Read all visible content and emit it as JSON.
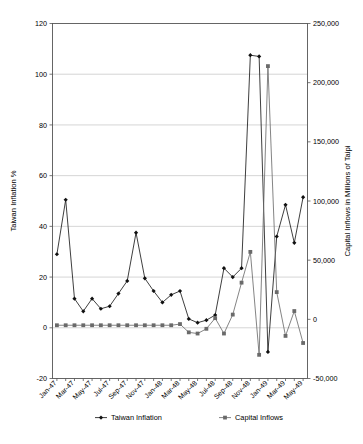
{
  "chart_data": {
    "type": "line",
    "title": "",
    "xlabel": "",
    "ylabel": "Taiwan Inflation %",
    "y2label": "Capital Inflows in Millions of Taipi",
    "ylim": [
      -20,
      120
    ],
    "y2lim": [
      -50000,
      250000
    ],
    "ytick_step": 20,
    "y2tick_step": 50000,
    "grid": true,
    "legend_position": "bottom",
    "yticks": [
      "120",
      "100",
      "80",
      "60",
      "40",
      "20",
      "0",
      "-20"
    ],
    "ytick_values": [
      120,
      100,
      80,
      60,
      40,
      20,
      0,
      -20
    ],
    "y2ticks": [
      "250,000",
      "200,000",
      "150,000",
      "100,000",
      "50,000",
      "0",
      "-50,000"
    ],
    "y2tick_values": [
      250000,
      200000,
      150000,
      100000,
      50000,
      0,
      -50000
    ],
    "x": [
      "Jan-47",
      "Feb-47",
      "Mar-47",
      "Apr-47",
      "May-47",
      "Jun-47",
      "Jul-47",
      "Aug-47",
      "Sep-47",
      "Oct-47",
      "Nov-47",
      "Dec-47",
      "Jan-48",
      "Feb-48",
      "Mar-48",
      "Apr-48",
      "May-48",
      "Jun-48",
      "Jul-48",
      "Aug-48",
      "Sep-48",
      "Oct-48",
      "Nov-48",
      "Dec-48",
      "Jan-49",
      "Feb-49",
      "Mar-49",
      "Apr-49",
      "May-49"
    ],
    "xticks_shown": [
      "Jan-47",
      "Mar-47",
      "May-47",
      "Jul-47",
      "Sep-47",
      "Nov-47",
      "Jan-48",
      "Mar-48",
      "May-48",
      "Jul-48",
      "Sep-48",
      "Nov-48",
      "Jan-49",
      "Mar-49"
    ],
    "xtick_interval": 2,
    "series": [
      {
        "name": "Taiwan Inflation",
        "axis": "left",
        "marker": "diamond",
        "color": "#111111",
        "values": [
          29.0,
          50.5,
          11.5,
          6.5,
          11.5,
          7.5,
          8.5,
          13.5,
          18.5,
          37.5,
          19.5,
          14.5,
          10.0,
          13.0,
          14.5,
          3.5,
          2.0,
          3.0,
          5.0,
          23.5,
          20.0,
          23.5,
          107.5,
          107.0,
          -9.5,
          36.0,
          48.5,
          33.5,
          51.5
        ]
      },
      {
        "name": "Capital  Inflows",
        "axis": "right",
        "marker": "square",
        "color": "#6a6a6a",
        "values": [
          -5000,
          -5000,
          -5000,
          -5000,
          -5000,
          -5000,
          -5000,
          -5000,
          -5000,
          -5000,
          -5000,
          -5000,
          -5000,
          -5000,
          -4000,
          -11000,
          -12000,
          -8000,
          1000,
          -12000,
          4000,
          31000,
          57000,
          -30000,
          214000,
          23000,
          -14000,
          7000,
          -20000
        ]
      }
    ]
  },
  "legend": {
    "entries": [
      {
        "label": "Taiwan Inflation",
        "marker": "diamond"
      },
      {
        "label": "Capital  Inflows",
        "marker": "square"
      }
    ]
  },
  "caption": {
    "text": ""
  }
}
